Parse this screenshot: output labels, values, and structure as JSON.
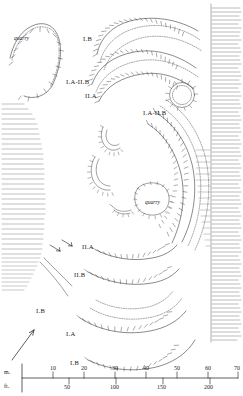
{
  "figure": {
    "type": "archaeological-site-plan"
  },
  "rampart_labels": [
    {
      "id": "IB-top",
      "text": "I.B",
      "x": 83,
      "y": 36
    },
    {
      "id": "IA-IIB-left",
      "text": "I.A-II.B",
      "x": 66,
      "y": 79
    },
    {
      "id": "IIA-left",
      "text": "II.A",
      "x": 85,
      "y": 93
    },
    {
      "id": "IA-IIB-right",
      "text": "I.A-II.B",
      "x": 143,
      "y": 110
    },
    {
      "id": "IIA-lower",
      "text": "II.A",
      "x": 82,
      "y": 244
    },
    {
      "id": "IIB-lower",
      "text": "II.B",
      "x": 74,
      "y": 272
    },
    {
      "id": "IB-left",
      "text": "I.B",
      "x": 36,
      "y": 308
    },
    {
      "id": "IA-bottom",
      "text": "I.A",
      "x": 66,
      "y": 331
    },
    {
      "id": "IB-bottom",
      "text": "I.B",
      "x": 70,
      "y": 360
    }
  ],
  "feature_labels": [
    {
      "id": "quarry-northwest",
      "text": "quarry",
      "x": 14,
      "y": 36
    },
    {
      "id": "quarry-center",
      "text": "quarry",
      "x": 145,
      "y": 200
    }
  ],
  "north_arrow": {
    "label": "",
    "x": 10,
    "y": 330
  },
  "scale_bar": {
    "metric_unit": "m.",
    "imperial_unit": "ft.",
    "metric_ticks": [
      "10",
      "20",
      "30",
      "40",
      "50",
      "60",
      "70"
    ],
    "imperial_ticks": [
      "50",
      "100",
      "150",
      "200"
    ],
    "axis_x_start": 22,
    "axis_x_end": 238,
    "metric_row_y": 371,
    "imperial_row_y": 385
  },
  "colors": {
    "ink": "#1a1a1a",
    "line": "#2b2b2b",
    "paper": "#ffffff",
    "hachure": "#333333"
  }
}
